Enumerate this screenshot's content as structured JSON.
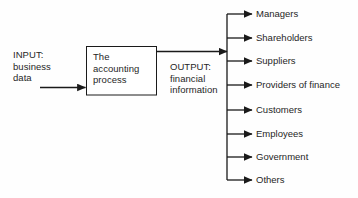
{
  "diagram": {
    "input": {
      "label": "INPUT:\nbusiness\ndata",
      "name": "input-block"
    },
    "process": {
      "label": "The\naccounting\nprocess",
      "name": "process-box"
    },
    "output": {
      "label": "OUTPUT:\nfinancial\ninformation",
      "name": "output-block"
    },
    "recipients": [
      {
        "label": "Managers",
        "y": 14
      },
      {
        "label": "Shareholders",
        "y": 38
      },
      {
        "label": "Suppliers",
        "y": 61
      },
      {
        "label": "Providers of finance",
        "y": 85
      },
      {
        "label": "Customers",
        "y": 110
      },
      {
        "label": "Employees",
        "y": 134
      },
      {
        "label": "Government",
        "y": 157
      },
      {
        "label": "Others",
        "y": 180
      }
    ],
    "colors": {
      "background": "#fefefe",
      "stroke": "#1a1a1a",
      "text": "#262626",
      "box_fill": "#ffffff"
    },
    "arrows": {
      "input_arrow": "arrow-right",
      "output_arrow": "arrow-right",
      "branch_arrow": "arrow-right"
    }
  }
}
